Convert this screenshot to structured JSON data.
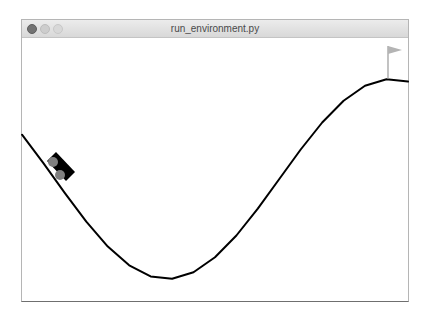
{
  "window": {
    "title": "run_environment.py",
    "controls": [
      {
        "name": "close",
        "color": "#737373"
      },
      {
        "name": "minimize",
        "color": "#cdcdcd"
      },
      {
        "name": "zoom",
        "color": "#d8d8d8"
      }
    ]
  },
  "scene": {
    "environment": "mountain-car",
    "track": {
      "color": "#000000",
      "stroke_width": 2,
      "points": "22,134.7 43.4,163.2 64.9,193.1 86.3,221.7 107.8,246.6 129.2,265.3 150.6,276.4 172.1,278.8 193.5,272.2 215.0,257.3 236.4,235.5 257.8,208.6 279.3,179 300.7,149.5 322.2,122.5 343.6,100.7 365.0,85.8 386.5,79.3 408,81.6"
    },
    "flag": {
      "pole_color": "#9a9a9a",
      "flag_color": "#b4b4b4",
      "pole": {
        "x": 388,
        "y1": 46,
        "y2": 79
      },
      "triangle": "388,46 402,50 388,54"
    },
    "car": {
      "body_color": "#000000",
      "wheel_color": "#7f7f7f",
      "body_points": "56,152 75,172 66,181 47,161",
      "wheels": [
        {
          "cx": 53,
          "cy": 162,
          "r": 5
        },
        {
          "cx": 60,
          "cy": 175,
          "r": 5
        }
      ]
    }
  }
}
